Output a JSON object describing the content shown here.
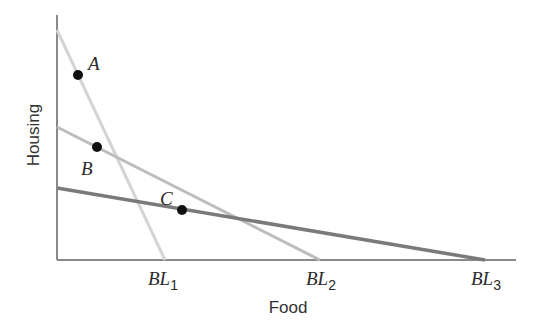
{
  "chart_data": {
    "type": "line",
    "title": "",
    "xlabel": "Food",
    "ylabel": "Housing",
    "grid": false,
    "legend": "none",
    "series": [
      {
        "name": "BL1",
        "label_main": "BL",
        "label_sub": "1",
        "color": "#d4d4d4",
        "width": 3,
        "points": [
          [
            57,
            30
          ],
          [
            165,
            260
          ]
        ]
      },
      {
        "name": "BL2",
        "label_main": "BL",
        "label_sub": "2",
        "color": "#bdbdbd",
        "width": 3,
        "points": [
          [
            57,
            127
          ],
          [
            320,
            260
          ]
        ]
      },
      {
        "name": "BL3",
        "label_main": "BL",
        "label_sub": "3",
        "color": "#7a7a7a",
        "width": 3.5,
        "points": [
          [
            57,
            188
          ],
          [
            485,
            260
          ]
        ]
      }
    ],
    "points": [
      {
        "label": "A",
        "x": 78,
        "y": 75,
        "label_x": 88,
        "label_y": 70
      },
      {
        "label": "B",
        "x": 97,
        "y": 147,
        "label_x": 81,
        "label_y": 175
      },
      {
        "label": "C",
        "x": 182,
        "y": 210,
        "label_x": 160,
        "label_y": 205
      }
    ],
    "axes": {
      "origin": [
        57,
        260
      ],
      "x_end": 516,
      "y_top": 15,
      "color": "#8a8a8a"
    }
  }
}
